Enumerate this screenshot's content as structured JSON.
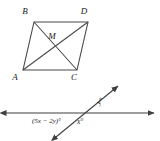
{
  "figure": {
    "stroke_color": "#4a4a4a",
    "text_color": "#1a1a1a",
    "background_color": "#ffffff",
    "parallelogram": {
      "name": "parallelogram-ABDC",
      "vertices": [
        {
          "id": "B",
          "label": "B",
          "x": 34,
          "y": 22,
          "label_x": 25,
          "label_y": 14
        },
        {
          "id": "D",
          "label": "D",
          "x": 88,
          "y": 22,
          "label_x": 84,
          "label_y": 14
        },
        {
          "id": "C",
          "label": "C",
          "x": 77,
          "y": 70,
          "label_x": 74,
          "label_y": 80
        },
        {
          "id": "A",
          "label": "A",
          "x": 23,
          "y": 70,
          "label_x": 15,
          "label_y": 80
        }
      ],
      "intersection": {
        "id": "M",
        "label": "M",
        "x": 55.5,
        "y": 46,
        "label_x": 52,
        "label_y": 38
      },
      "diagonals": [
        {
          "name": "diagonal-BC",
          "from": "B",
          "to": "C"
        },
        {
          "name": "diagonal-AD",
          "from": "A",
          "to": "D"
        }
      ]
    },
    "transversal_diagram": {
      "name": "intersecting-lines-diagram",
      "horizontal_line": {
        "x1": 5,
        "y1": 113,
        "x2": 155,
        "y2": 113
      },
      "slanted_line": {
        "x1": 55,
        "y1": 138,
        "x2": 119,
        "y2": 85
      },
      "intersection_point": {
        "x": 87,
        "y": 111
      },
      "labels": [
        {
          "id": "expr",
          "text": "(5x − 2y)°",
          "x": 32,
          "y": 122
        },
        {
          "id": "x",
          "text": "x°",
          "x": 77,
          "y": 124
        },
        {
          "id": "y",
          "text": "y°",
          "x": 99,
          "y": 104
        }
      ]
    }
  }
}
